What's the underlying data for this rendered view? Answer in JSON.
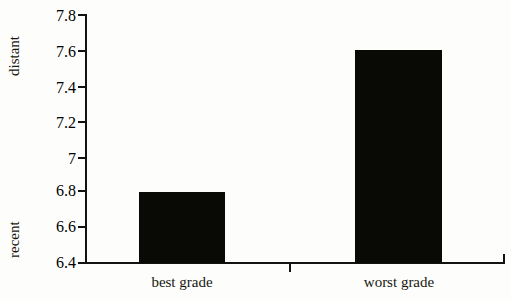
{
  "chart_data": {
    "type": "bar",
    "title": "",
    "subtitle": "",
    "xlabel": "",
    "ylabel": "",
    "categories": [
      "best grade",
      "worst grade"
    ],
    "values": [
      6.8,
      7.6
    ],
    "series": [
      {
        "name": "",
        "values": [
          6.8,
          7.6
        ]
      }
    ],
    "ylim": [
      6.4,
      7.8
    ],
    "ytick_labels": [
      "7.8",
      "7.6",
      "7.4",
      "7.2",
      "7",
      "6.8",
      "6.6",
      "6.4"
    ],
    "ytick_values": [
      7.8,
      7.6,
      7.4,
      7.2,
      7.0,
      6.8,
      6.6,
      6.4
    ],
    "ytick_step": 0.2,
    "grid": false,
    "legend": "none",
    "axis_pole_top": "distant",
    "axis_pole_bottom": "recent",
    "annotations": [],
    "bar_color": "#090906",
    "axis_color": "#121210",
    "background_color": "#fdfdfc",
    "text_color": "#18170f"
  }
}
